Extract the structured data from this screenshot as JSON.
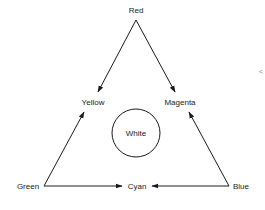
{
  "diagram": {
    "nodes": {
      "red": {
        "label": "Red"
      },
      "yellow": {
        "label": "Yellow"
      },
      "magenta": {
        "label": "Magenta"
      },
      "white": {
        "label": "White"
      },
      "green": {
        "label": "Green"
      },
      "cyan": {
        "label": "Cyan"
      },
      "blue": {
        "label": "Blue"
      }
    },
    "edges": [
      {
        "from": "Red",
        "to": "Yellow"
      },
      {
        "from": "Red",
        "to": "Magenta"
      },
      {
        "from": "Green",
        "to": "Yellow"
      },
      {
        "from": "Green",
        "to": "Cyan"
      },
      {
        "from": "Blue",
        "to": "Cyan"
      },
      {
        "from": "Blue",
        "to": "Magenta"
      }
    ],
    "margin_mark": "<"
  }
}
